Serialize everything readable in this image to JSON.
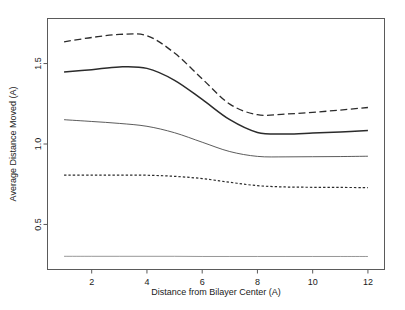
{
  "chart_data": {
    "type": "line",
    "title": "",
    "xlabel": "Distance from Bilayer Center (A)",
    "ylabel": "Average Distance Moved (A)",
    "xlim": [
      0.4,
      12.6
    ],
    "ylim": [
      0.22,
      1.78
    ],
    "xticks": [
      2,
      4,
      6,
      8,
      10,
      12
    ],
    "xtick_labels": [
      "2",
      "4",
      "6",
      "8",
      "10",
      "12"
    ],
    "yticks": [
      0.5,
      1.0,
      1.5
    ],
    "ytick_labels": [
      "0.5",
      "1.0",
      "1.5"
    ],
    "grid": false,
    "legend": "none",
    "x": [
      1,
      2,
      3,
      4,
      5,
      6,
      7,
      8,
      9,
      10,
      11,
      12
    ],
    "series": [
      {
        "name": "series-1-dashed-top",
        "style": "dashed",
        "width": 1.3,
        "color": "#2b2b2b",
        "values": [
          1.635,
          1.662,
          1.681,
          1.673,
          1.565,
          1.405,
          1.248,
          1.182,
          1.186,
          1.197,
          1.211,
          1.227
        ]
      },
      {
        "name": "series-2-solid-thick",
        "style": "solid",
        "width": 1.5,
        "color": "#2b2b2b",
        "values": [
          1.447,
          1.462,
          1.479,
          1.47,
          1.396,
          1.277,
          1.151,
          1.072,
          1.062,
          1.068,
          1.075,
          1.084
        ]
      },
      {
        "name": "series-3-solid-thin",
        "style": "solid",
        "width": 0.9,
        "color": "#4a4a4a",
        "values": [
          1.151,
          1.14,
          1.128,
          1.11,
          1.07,
          1.011,
          0.953,
          0.923,
          0.92,
          0.921,
          0.922,
          0.924
        ]
      },
      {
        "name": "series-4-dotted",
        "style": "dotted",
        "width": 1.2,
        "color": "#2b2b2b",
        "values": [
          0.806,
          0.806,
          0.807,
          0.806,
          0.799,
          0.785,
          0.762,
          0.741,
          0.733,
          0.731,
          0.73,
          0.729
        ]
      },
      {
        "name": "series-5-solid-baseline",
        "style": "solid",
        "width": 0.7,
        "color": "#6a6a6a",
        "values": [
          0.302,
          0.302,
          0.302,
          0.302,
          0.302,
          0.301,
          0.301,
          0.301,
          0.301,
          0.301,
          0.301,
          0.301
        ]
      }
    ]
  }
}
